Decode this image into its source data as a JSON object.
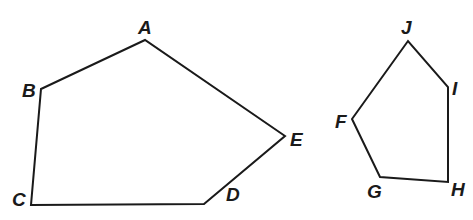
{
  "figure": {
    "width": 473,
    "height": 220,
    "stroke_color": "#1a1a1a",
    "polygons": [
      {
        "name": "ABCDE",
        "vertices": [
          {
            "label": "A",
            "x": 145,
            "y": 40,
            "lx": 138,
            "ly": 34
          },
          {
            "label": "B",
            "x": 41,
            "y": 89,
            "lx": 22,
            "ly": 97
          },
          {
            "label": "C",
            "x": 31,
            "y": 205,
            "lx": 12,
            "ly": 206
          },
          {
            "label": "D",
            "x": 204,
            "y": 204,
            "lx": 226,
            "ly": 201
          },
          {
            "label": "E",
            "x": 285,
            "y": 136,
            "lx": 290,
            "ly": 146
          }
        ]
      },
      {
        "name": "FGHIJ",
        "vertices": [
          {
            "label": "F",
            "x": 352,
            "y": 119,
            "lx": 335,
            "ly": 128
          },
          {
            "label": "G",
            "x": 380,
            "y": 177,
            "lx": 367,
            "ly": 198
          },
          {
            "label": "H",
            "x": 448,
            "y": 182,
            "lx": 451,
            "ly": 196
          },
          {
            "label": "I",
            "x": 448,
            "y": 87,
            "lx": 452,
            "ly": 95
          },
          {
            "label": "J",
            "x": 408,
            "y": 41,
            "lx": 401,
            "ly": 34
          }
        ]
      }
    ]
  },
  "labels": {
    "A": "A",
    "B": "B",
    "C": "C",
    "D": "D",
    "E": "E",
    "F": "F",
    "G": "G",
    "H": "H",
    "I": "I",
    "J": "J"
  }
}
